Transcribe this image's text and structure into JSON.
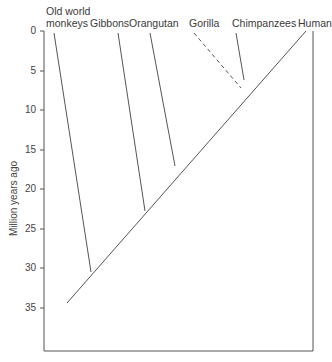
{
  "diagram": {
    "type": "phylogenetic-tree",
    "y_axis_label": "Million years ago",
    "y_ticks": [
      "0",
      "5",
      "10",
      "15",
      "20",
      "25",
      "30",
      "35"
    ],
    "taxa": [
      {
        "name_line1": "Old world",
        "name_line2": "monkeys",
        "divergence_mya": 30
      },
      {
        "name_line1": "",
        "name_line2": "Gibbons",
        "divergence_mya": 20
      },
      {
        "name_line1": "",
        "name_line2": "Orangutan",
        "divergence_mya": 17
      },
      {
        "name_line1": "",
        "name_line2": "Gorilla",
        "divergence_mya": 7,
        "dashed": true
      },
      {
        "name_line1": "",
        "name_line2": "Chimpanzees",
        "divergence_mya": 6
      },
      {
        "name_line1": "",
        "name_line2": "Human",
        "divergence_mya": 0
      }
    ],
    "line_color": "#555555"
  }
}
